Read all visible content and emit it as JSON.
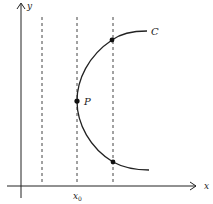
{
  "diagram": {
    "axes": {
      "x_label": "x",
      "y_label": "y"
    },
    "curve": {
      "label": "C"
    },
    "point": {
      "label": "P"
    },
    "tick": {
      "label": "x",
      "subscript": "0"
    },
    "vertical_lines": 3,
    "marked_points": 3,
    "colors": {
      "stroke": "#222222",
      "dashed": "#444444",
      "background": "#ffffff"
    }
  }
}
